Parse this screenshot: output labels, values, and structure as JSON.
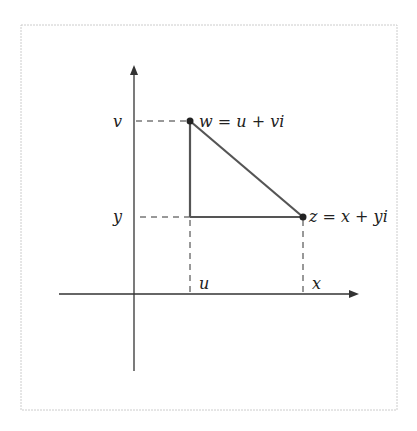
{
  "diagram": {
    "labels": {
      "v": "v",
      "y": "y",
      "u": "u",
      "x": "x",
      "w_point": "w = u + vi",
      "z_point": "z = x + yi"
    },
    "colors": {
      "line": "#333333",
      "frame": "#cccccc"
    }
  }
}
